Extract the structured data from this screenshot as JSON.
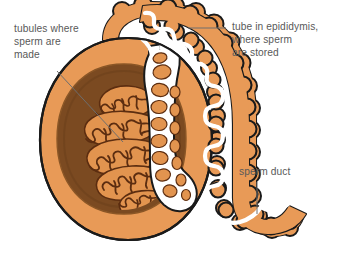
{
  "diagram": {
    "background_color": "#ffffff"
  },
  "labels": {
    "tubules": {
      "name": "tubules-label",
      "text": "tubules where\nsperm are\nmade",
      "lines": [
        "tubules where",
        "sperm are",
        "made"
      ],
      "x": 14,
      "y": 22,
      "color": "#595959"
    },
    "epididymis": {
      "name": "epididymis-label",
      "text": "tube in epididymis,\nwhere sperm\nare stored",
      "lines": [
        "tube in epididymis,",
        "where sperm",
        "are stored"
      ],
      "x": 232,
      "y": 20,
      "color": "#595959"
    },
    "sperm_duct": {
      "name": "sperm-duct-label",
      "text": "sperm duct",
      "lines": [
        "sperm duct"
      ],
      "x": 239,
      "y": 165,
      "color": "#595959"
    }
  },
  "leaders": [
    {
      "name": "leader-tubules",
      "from_x": 57,
      "from_y": 71,
      "to_x": 123,
      "to_y": 142
    },
    {
      "name": "leader-epididymis",
      "from_x": 188,
      "from_y": 28,
      "to_x": 226,
      "to_y": 28
    },
    {
      "name": "leader-sperm-duct",
      "from_x": 257,
      "from_y": 182,
      "to_x": 257,
      "to_y": 214
    }
  ],
  "colors": {
    "outline": "#1a1a1a",
    "capsule_orange": "#e89a57",
    "capsule_orange_light": "#edae72",
    "interior_brown": "#7b4a21",
    "interior_brown_dark": "#6b3f1b",
    "lobule_orange": "#e2944f",
    "tubule_line": "#5c2d10",
    "rete_white": "#ffffff",
    "duct_white": "#ffffff",
    "label_grey": "#595959",
    "leader_grey": "#6e6e6e"
  },
  "parts": [
    {
      "name": "testis-capsule",
      "label": "testis outer capsule",
      "color": "#e89a57"
    },
    {
      "name": "testis-interior",
      "label": "testis interior (mediastinum)",
      "color": "#7b4a21"
    },
    {
      "name": "seminiferous-lobules",
      "label": "lobules containing seminiferous tubules",
      "count": 5,
      "color": "#e2944f"
    },
    {
      "name": "rete-testis",
      "label": "rete testis network",
      "color": "#ffffff"
    },
    {
      "name": "epididymis-body",
      "label": "coiled epididymis duct",
      "color": "#e89a57"
    },
    {
      "name": "vas-deferens",
      "label": "sperm duct / vas deferens",
      "color": "#e89a57"
    }
  ]
}
